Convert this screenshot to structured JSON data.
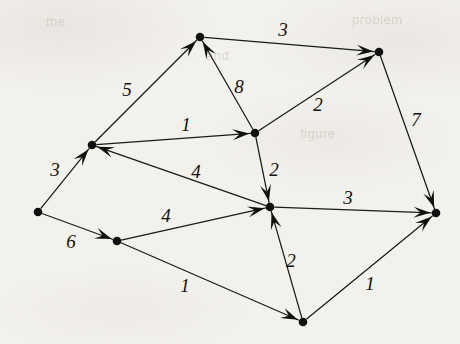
{
  "figure": {
    "kind": "directed-weighted-graph",
    "background_color": "#f3f1ec",
    "ink_color": "#101010"
  },
  "ghost_text": [
    {
      "text": "problem",
      "x": 352,
      "y": 12
    },
    {
      "text": "and",
      "x": 206,
      "y": 48
    },
    {
      "text": "figure",
      "x": 300,
      "y": 126
    },
    {
      "text": "the",
      "x": 46,
      "y": 14
    }
  ],
  "nodes": [
    {
      "id": "n_top",
      "label": "top-node",
      "x": 200,
      "y": 37
    },
    {
      "id": "n_topright",
      "label": "top-right-node",
      "x": 379,
      "y": 52
    },
    {
      "id": "n_upperleft",
      "label": "upper-left-node",
      "x": 92,
      "y": 145
    },
    {
      "id": "n_midupper",
      "label": "mid-upper-node",
      "x": 255,
      "y": 133
    },
    {
      "id": "n_hub",
      "label": "center-hub-node",
      "x": 270,
      "y": 207
    },
    {
      "id": "n_right",
      "label": "right-node",
      "x": 436,
      "y": 213
    },
    {
      "id": "n_left",
      "label": "far-left-node",
      "x": 38,
      "y": 212
    },
    {
      "id": "n_lowerleft",
      "label": "lower-left-node",
      "x": 117,
      "y": 241
    },
    {
      "id": "n_bottom",
      "label": "bottom-node",
      "x": 303,
      "y": 322
    }
  ],
  "edges": [
    {
      "id": "e_top_topright",
      "from": "n_top",
      "to": "n_topright",
      "weight": "3",
      "label_x": 283,
      "label_y": 32
    },
    {
      "id": "e_upperleft_top",
      "from": "n_upperleft",
      "to": "n_top",
      "weight": "5",
      "label_x": 127,
      "label_y": 92
    },
    {
      "id": "e_midupper_top",
      "from": "n_midupper",
      "to": "n_top",
      "weight": "8",
      "label_x": 239,
      "label_y": 89
    },
    {
      "id": "e_midupper_topright",
      "from": "n_midupper",
      "to": "n_topright",
      "weight": "2",
      "label_x": 318,
      "label_y": 107
    },
    {
      "id": "e_topright_right",
      "from": "n_topright",
      "to": "n_right",
      "weight": "7",
      "label_x": 416,
      "label_y": 122
    },
    {
      "id": "e_upperleft_midupper",
      "from": "n_upperleft",
      "to": "n_midupper",
      "weight": "1",
      "label_x": 186,
      "label_y": 127
    },
    {
      "id": "e_left_upperleft",
      "from": "n_left",
      "to": "n_upperleft",
      "weight": "3",
      "label_x": 55,
      "label_y": 172
    },
    {
      "id": "e_hub_upperleft",
      "from": "n_hub",
      "to": "n_upperleft",
      "weight": "4",
      "label_x": 196,
      "label_y": 174
    },
    {
      "id": "e_midupper_hub",
      "from": "n_midupper",
      "to": "n_hub",
      "weight": "2",
      "label_x": 274,
      "label_y": 172
    },
    {
      "id": "e_hub_right",
      "from": "n_hub",
      "to": "n_right",
      "weight": "3",
      "label_x": 348,
      "label_y": 200
    },
    {
      "id": "e_left_lowerleft",
      "from": "n_left",
      "to": "n_lowerleft",
      "weight": "6",
      "label_x": 71,
      "label_y": 244
    },
    {
      "id": "e_lowerleft_hub",
      "from": "n_lowerleft",
      "to": "n_hub",
      "weight": "4",
      "label_x": 166,
      "label_y": 218
    },
    {
      "id": "e_lowerleft_bottom",
      "from": "n_lowerleft",
      "to": "n_bottom",
      "weight": "1",
      "label_x": 185,
      "label_y": 288
    },
    {
      "id": "e_bottom_hub",
      "from": "n_bottom",
      "to": "n_hub",
      "weight": "2",
      "label_x": 291,
      "label_y": 263
    },
    {
      "id": "e_bottom_right",
      "from": "n_bottom",
      "to": "n_right",
      "weight": "1",
      "label_x": 370,
      "label_y": 286
    }
  ],
  "graph_data": {
    "type": "directed-weighted-graph",
    "node_count": 9,
    "edge_count": 15,
    "weights": [
      "3",
      "5",
      "8",
      "2",
      "7",
      "1",
      "3",
      "4",
      "2",
      "3",
      "6",
      "4",
      "1",
      "2",
      "1"
    ]
  }
}
